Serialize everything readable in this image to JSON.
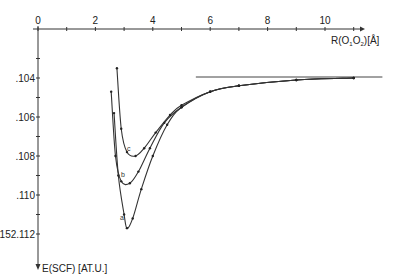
{
  "chart_data": {
    "type": "line",
    "title": "",
    "xlabel": "R(O1O2) [Å]",
    "ylabel": "E(SCF) [AT.U.]",
    "xlim": [
      0,
      12
    ],
    "ylim": [
      -152.112,
      -152.103
    ],
    "x_ticks": [
      "0",
      "2",
      "4",
      "6",
      "8",
      "10"
    ],
    "y_ticks": [
      ".104",
      ".106",
      ".108",
      ".110",
      "-152.112"
    ],
    "x_axis_position": "top",
    "y_axis_inverted": true,
    "grid": false,
    "legend": "inline curve labels a, b, c",
    "asymptote": {
      "y": -152.104,
      "x_start": 5.5,
      "x_end": 12.0
    },
    "series": [
      {
        "name": "a",
        "x": [
          2.65,
          2.8,
          3.0,
          3.1,
          3.3,
          3.6,
          4.0,
          4.5,
          5.0,
          6.0,
          7.0,
          9.0,
          11.0
        ],
        "y": [
          -152.1058,
          -152.109,
          -152.111,
          -152.1117,
          -152.1112,
          -152.1097,
          -152.108,
          -152.1064,
          -152.1055,
          -152.1047,
          -152.1044,
          -152.1041,
          -152.104
        ]
      },
      {
        "name": "b",
        "x": [
          2.55,
          2.7,
          2.9,
          3.2,
          3.5,
          3.9,
          4.4,
          5.0,
          6.0,
          7.0,
          9.0,
          11.0
        ],
        "y": [
          -152.1047,
          -152.108,
          -152.1093,
          -152.1094,
          -152.1088,
          -152.1076,
          -152.1063,
          -152.1055,
          -152.1047,
          -152.1044,
          -152.1041,
          -152.104
        ]
      },
      {
        "name": "c",
        "x": [
          2.75,
          2.9,
          3.1,
          3.4,
          3.7,
          4.1,
          4.6,
          5.0,
          6.0,
          7.0,
          9.0,
          11.0
        ],
        "y": [
          -152.1035,
          -152.1066,
          -152.1078,
          -152.108,
          -152.1076,
          -152.1068,
          -152.1059,
          -152.1054,
          -152.1047,
          -152.1044,
          -152.1041,
          -152.104
        ]
      }
    ]
  },
  "axes": {
    "x_title": "R(O",
    "x_sub1": "1",
    "x_mid": "O",
    "x_sub2": "2",
    "x_unit": ")[Å]",
    "y_title": "E(SCF)  [AT.U.]"
  },
  "labels": {
    "a": "a",
    "b": "b",
    "c": "c"
  }
}
